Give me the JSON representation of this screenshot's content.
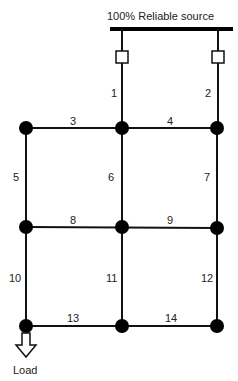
{
  "title": "100% Reliable source",
  "load_label": "Load",
  "colors": {
    "line": "#111111",
    "node": "#000000",
    "background": "#ffffff"
  },
  "nodes": [
    {
      "id": "A",
      "x": 26,
      "y": 128
    },
    {
      "id": "B",
      "x": 122,
      "y": 128
    },
    {
      "id": "C",
      "x": 217,
      "y": 128
    },
    {
      "id": "D",
      "x": 26,
      "y": 227
    },
    {
      "id": "E",
      "x": 122,
      "y": 227
    },
    {
      "id": "F",
      "x": 217,
      "y": 228
    },
    {
      "id": "G",
      "x": 26,
      "y": 326
    },
    {
      "id": "H",
      "x": 122,
      "y": 326
    },
    {
      "id": "I",
      "x": 217,
      "y": 326
    }
  ],
  "branches": [
    {
      "label": "1",
      "from": "source",
      "to": "B"
    },
    {
      "label": "2",
      "from": "source",
      "to": "C"
    },
    {
      "label": "3",
      "from": "A",
      "to": "B"
    },
    {
      "label": "4",
      "from": "B",
      "to": "C"
    },
    {
      "label": "5",
      "from": "A",
      "to": "D"
    },
    {
      "label": "6",
      "from": "B",
      "to": "E"
    },
    {
      "label": "7",
      "from": "C",
      "to": "F"
    },
    {
      "label": "8",
      "from": "D",
      "to": "E"
    },
    {
      "label": "9",
      "from": "E",
      "to": "F"
    },
    {
      "label": "10",
      "from": "D",
      "to": "G"
    },
    {
      "label": "11",
      "from": "E",
      "to": "H"
    },
    {
      "label": "12",
      "from": "F",
      "to": "I"
    },
    {
      "label": "13",
      "from": "G",
      "to": "H"
    },
    {
      "label": "14",
      "from": "H",
      "to": "I"
    }
  ]
}
